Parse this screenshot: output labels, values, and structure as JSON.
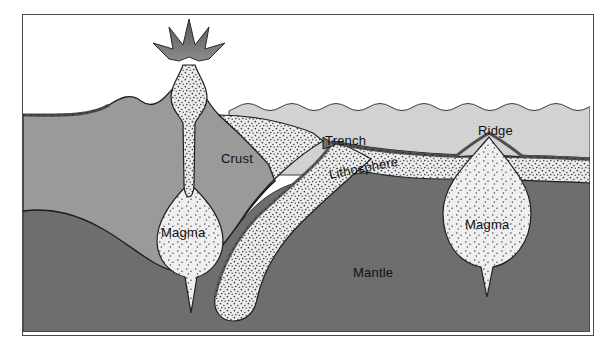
{
  "figure": {
    "frame": {
      "border_color": "#4a4a4a",
      "background": "#ffffff"
    }
  },
  "palette": {
    "water": "#d2d2d2",
    "continent": "#9a9a9a",
    "mantle": "#6e6e6e",
    "lithosphere_fill": "#ececec",
    "magma_fill": "#ededed",
    "crust_line": "#5a5a5a",
    "outline": "#1f1f1f",
    "ash": "#5f5f5f",
    "stipple": "#3d3d3d",
    "label_text": "#111111"
  },
  "labels": [
    {
      "id": "crust",
      "text": "Crust",
      "x": 198,
      "y": 148,
      "rotate": 0,
      "anchor": "start"
    },
    {
      "id": "trench",
      "text": "Trench",
      "x": 302,
      "y": 130,
      "rotate": 0,
      "anchor": "start"
    },
    {
      "id": "lithosphere",
      "text": "Lithosphere",
      "x": 307,
      "y": 164,
      "rotate": -11,
      "anchor": "start"
    },
    {
      "id": "ridge",
      "text": "Ridge",
      "x": 455,
      "y": 120,
      "rotate": 0,
      "anchor": "start"
    },
    {
      "id": "magma_left",
      "text": "Magma",
      "x": 148,
      "y": 222,
      "rotate": 0,
      "anchor": "start"
    },
    {
      "id": "magma_right",
      "text": "Magma",
      "x": 455,
      "y": 214,
      "rotate": 0,
      "anchor": "start"
    },
    {
      "id": "mantle",
      "text": "Mantle",
      "x": 340,
      "y": 262,
      "rotate": 0,
      "anchor": "start"
    }
  ],
  "features": [
    {
      "name": "volcano",
      "description": "erupting volcanic cone with ash plume"
    },
    {
      "name": "volcanic-conduit",
      "description": "stippled magma conduit from chamber to vent"
    },
    {
      "name": "magma-chamber-left",
      "description": "teardrop magma chamber beneath volcano"
    },
    {
      "name": "continental-crust",
      "description": "continental landmass with thick root"
    },
    {
      "name": "ocean-water",
      "description": "sea water layer with wavy surface"
    },
    {
      "name": "subduction-slab",
      "description": "oceanic plate descending into mantle"
    },
    {
      "name": "ocean-trench",
      "description": "deep-sea trench at plate boundary"
    },
    {
      "name": "mid-ocean-ridge",
      "description": "spreading ridge with rift valley"
    },
    {
      "name": "magma-plume-right",
      "description": "rising magma body beneath ridge"
    },
    {
      "name": "mantle-layer",
      "description": "dark mantle underlying all plates"
    }
  ]
}
